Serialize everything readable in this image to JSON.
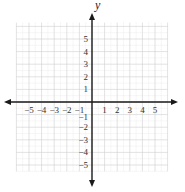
{
  "diagram": {
    "type": "coordinate-plane",
    "x_axis_label": "",
    "y_axis_label": "y",
    "x_ticks": [
      {
        "value": -5,
        "label": "−5"
      },
      {
        "value": -4,
        "label": "−4"
      },
      {
        "value": -3,
        "label": "−3"
      },
      {
        "value": -2,
        "label": "−2"
      },
      {
        "value": -1,
        "label": "−1"
      },
      {
        "value": 1,
        "label": "1"
      },
      {
        "value": 2,
        "label": "2"
      },
      {
        "value": 3,
        "label": "3"
      },
      {
        "value": 4,
        "label": "4"
      },
      {
        "value": 5,
        "label": "5"
      }
    ],
    "y_ticks": [
      {
        "value": 5,
        "label": "5"
      },
      {
        "value": 4,
        "label": "4"
      },
      {
        "value": 3,
        "label": "3"
      },
      {
        "value": 2,
        "label": "2"
      },
      {
        "value": 1,
        "label": "1"
      },
      {
        "value": -1,
        "label": "−1"
      },
      {
        "value": -2,
        "label": "−2"
      },
      {
        "value": -3,
        "label": "−3"
      },
      {
        "value": -4,
        "label": "−4"
      },
      {
        "value": -5,
        "label": "−5"
      }
    ],
    "grid": {
      "x_min": -6,
      "x_max": 6,
      "y_min": -5.5,
      "y_max": 6.3,
      "minor_step": 0.5
    },
    "colors": {
      "axis": "#1a1a1a",
      "grid_major": "#cfcfcf",
      "grid_minor": "#e2e2e2",
      "text": "#333333"
    }
  }
}
